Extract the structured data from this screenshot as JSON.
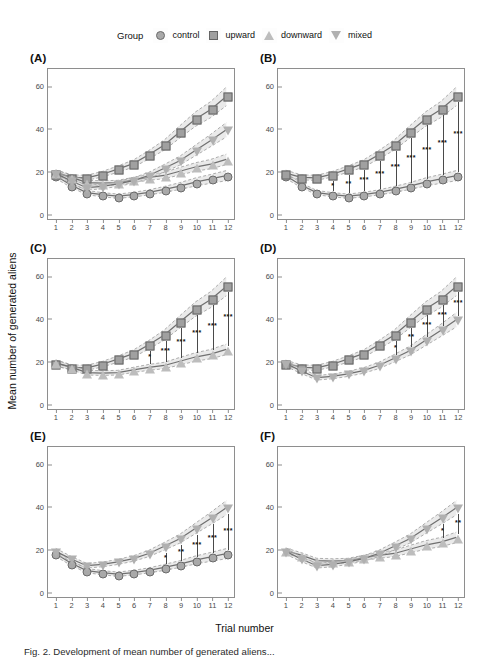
{
  "figure": {
    "xlabel": "Trial number",
    "ylabel": "Mean number of generated aliens",
    "caption": "Fig. 2. Development of mean number of generated aliens..."
  },
  "legend": {
    "title": "Group",
    "items": [
      {
        "label": "control",
        "marker": "circle-icon"
      },
      {
        "label": "upward",
        "marker": "square-icon"
      },
      {
        "label": "downward",
        "marker": "triangle-up-icon"
      },
      {
        "label": "mixed",
        "marker": "triangle-down-icon"
      }
    ]
  },
  "chart_data": {
    "type": "line",
    "title": "",
    "xlabel": "Trial number",
    "ylabel": "Mean number of generated aliens",
    "x": [
      1,
      2,
      3,
      4,
      5,
      6,
      7,
      8,
      9,
      10,
      11,
      12
    ],
    "xlim": [
      0.5,
      12.5
    ],
    "ylim": [
      -3,
      68
    ],
    "yticks": [
      0,
      20,
      40,
      60
    ],
    "xticks": [
      1,
      2,
      3,
      4,
      5,
      6,
      7,
      8,
      9,
      10,
      11,
      12
    ],
    "grid": false,
    "legend_position": "top-center",
    "series": [
      {
        "name": "control",
        "marker": "circle",
        "values": [
          17.5,
          13.0,
          9.5,
          8.5,
          7.8,
          8.5,
          9.6,
          11.0,
          12.6,
          14.5,
          16.0,
          17.5
        ]
      },
      {
        "name": "upward",
        "marker": "square",
        "values": [
          18.7,
          16.7,
          16.5,
          18.2,
          20.6,
          23.2,
          27.4,
          32.0,
          38.2,
          44.2,
          48.8,
          55.0
        ]
      },
      {
        "name": "downward",
        "marker": "triangle-up",
        "values": [
          18.8,
          16.8,
          14.2,
          14.0,
          14.2,
          15.5,
          16.7,
          17.6,
          19.6,
          21.6,
          23.0,
          25.2
        ]
      },
      {
        "name": "mixed",
        "marker": "triangle-down",
        "values": [
          18.6,
          15.0,
          11.8,
          12.4,
          13.6,
          15.2,
          17.6,
          21.0,
          24.6,
          29.4,
          34.2,
          39.2
        ]
      }
    ],
    "panels": [
      {
        "tag": "(A)",
        "groups": [
          "control",
          "upward",
          "downward",
          "mixed"
        ],
        "comparison": "all groups",
        "significance": []
      },
      {
        "tag": "(B)",
        "groups": [
          "control",
          "upward"
        ],
        "comparison": "control vs upward",
        "significance": [
          {
            "x": 4,
            "stars": "*"
          },
          {
            "x": 5,
            "stars": "**"
          },
          {
            "x": 6,
            "stars": "***"
          },
          {
            "x": 7,
            "stars": "***"
          },
          {
            "x": 8,
            "stars": "***"
          },
          {
            "x": 9,
            "stars": "***"
          },
          {
            "x": 10,
            "stars": "***"
          },
          {
            "x": 11,
            "stars": "***"
          },
          {
            "x": 12,
            "stars": "***"
          }
        ]
      },
      {
        "tag": "(C)",
        "groups": [
          "upward",
          "downward"
        ],
        "comparison": "upward vs downward",
        "significance": [
          {
            "x": 7,
            "stars": "*"
          },
          {
            "x": 8,
            "stars": "***"
          },
          {
            "x": 9,
            "stars": "***"
          },
          {
            "x": 10,
            "stars": "***"
          },
          {
            "x": 11,
            "stars": "***"
          },
          {
            "x": 12,
            "stars": "***"
          }
        ]
      },
      {
        "tag": "(D)",
        "groups": [
          "upward",
          "mixed"
        ],
        "comparison": "upward vs mixed",
        "significance": [
          {
            "x": 8,
            "stars": "*"
          },
          {
            "x": 9,
            "stars": "**"
          },
          {
            "x": 10,
            "stars": "***"
          },
          {
            "x": 11,
            "stars": "***"
          },
          {
            "x": 12,
            "stars": "***"
          }
        ]
      },
      {
        "tag": "(E)",
        "groups": [
          "control",
          "mixed"
        ],
        "comparison": "control vs mixed",
        "significance": [
          {
            "x": 8,
            "stars": "*"
          },
          {
            "x": 9,
            "stars": "**"
          },
          {
            "x": 10,
            "stars": "***"
          },
          {
            "x": 11,
            "stars": "***"
          },
          {
            "x": 12,
            "stars": "***"
          }
        ]
      },
      {
        "tag": "(F)",
        "groups": [
          "downward",
          "mixed"
        ],
        "comparison": "downward vs mixed",
        "significance": [
          {
            "x": 11,
            "stars": "*"
          },
          {
            "x": 12,
            "stars": "**"
          }
        ]
      }
    ],
    "ci_band_half_width": {
      "control": [
        1.3,
        1.1,
        1.0,
        1.0,
        1.0,
        1.1,
        1.2,
        1.4,
        1.6,
        1.9,
        2.1,
        2.4
      ],
      "upward": [
        1.4,
        1.2,
        1.2,
        1.3,
        1.5,
        1.7,
        2.0,
        2.4,
        2.9,
        3.4,
        3.8,
        4.4
      ],
      "downward": [
        1.4,
        1.2,
        1.1,
        1.1,
        1.1,
        1.2,
        1.4,
        1.5,
        1.8,
        2.0,
        2.2,
        2.5
      ],
      "mixed": [
        1.4,
        1.2,
        1.1,
        1.1,
        1.2,
        1.3,
        1.5,
        1.8,
        2.1,
        2.5,
        2.9,
        3.4
      ]
    },
    "colors": {
      "marker_fill": "#a9a9a9",
      "marker_edge": "#666666",
      "line": "#707070",
      "ci_band": "#cccccc",
      "axis": "#8e8e8e",
      "text": "#111111"
    }
  }
}
